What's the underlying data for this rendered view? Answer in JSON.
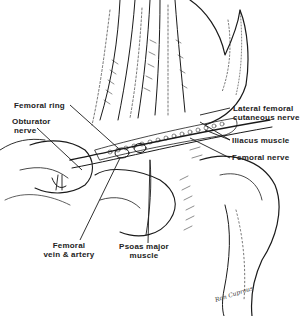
{
  "figure": {
    "type": "anatomical illustration",
    "labels": {
      "femoral_ring": "Femoral  ring",
      "obturator_nerve_1": "Obturator",
      "obturator_nerve_2": "nerve",
      "lateral_femoral_1": "Lateral  femoral",
      "lateral_femoral_2": "cutaneous  nerve",
      "iliacus": "Iliacus  muscle",
      "femoral_nerve": "Femoral  nerve",
      "femoral_vessels_1": "Femoral",
      "femoral_vessels_2": "vein & artery",
      "psoas_1": "Psoas  major",
      "psoas_2": "muscle"
    },
    "signature": "Ron Cuprous",
    "colors": {
      "ink": "#1a1a1a",
      "background": "#ffffff"
    }
  }
}
